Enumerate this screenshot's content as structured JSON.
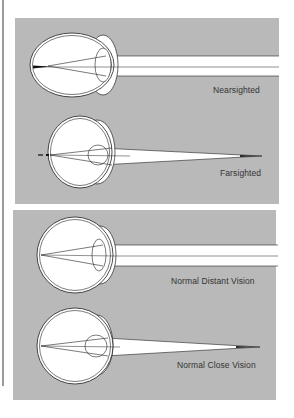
{
  "figure": {
    "panels": [
      {
        "name": "refractive-errors",
        "diagrams": [
          {
            "label": "Nearsighted"
          },
          {
            "label": "Farsighted"
          }
        ]
      },
      {
        "name": "normal-vision",
        "diagrams": [
          {
            "label": "Normal Distant Vision"
          },
          {
            "label": "Normal Close Vision"
          }
        ]
      }
    ],
    "colors": {
      "panel_background": "#b9b9b9",
      "eye_fill": "#ffffff",
      "stroke": "#222222",
      "page_background": "#ffffff"
    }
  }
}
